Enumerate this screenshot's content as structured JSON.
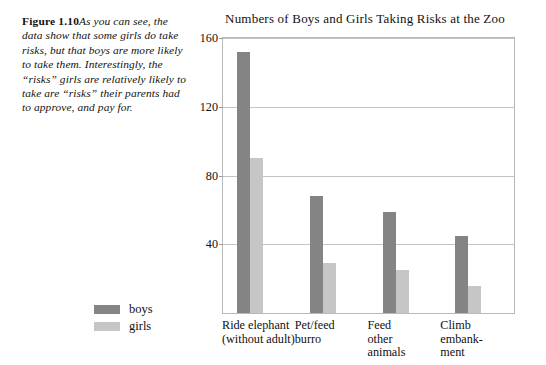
{
  "caption": {
    "label": "Figure 1.10",
    "text": "As you can see, the data show that some girls do take risks, but that boys are more likely to take them. Interestingly, the “risks” girls are relatively likely to take are “risks” their parents had to approve, and pay for."
  },
  "legend": {
    "position": "left-of-plot",
    "entries": [
      {
        "label": "boys",
        "color": "#848484"
      },
      {
        "label": "girls",
        "color": "#c6c6c6"
      }
    ]
  },
  "chart_data": {
    "type": "bar",
    "title": "Numbers of Boys and Girls Taking Risks at the Zoo",
    "xlabel": "",
    "ylabel": "",
    "ylim": [
      0,
      160
    ],
    "yticks": [
      40,
      80,
      120,
      160
    ],
    "ytick_labels": [
      "40",
      "80",
      "120",
      "160"
    ],
    "grid": true,
    "categories": [
      "Ride elephant\n(without adult)",
      "Pet/feed\nburro",
      "Feed\nother\nanimals",
      "Climb\nembank-\nment"
    ],
    "series": [
      {
        "name": "boys",
        "color": "#848484",
        "values": [
          152,
          68,
          59,
          45
        ]
      },
      {
        "name": "girls",
        "color": "#c6c6c6",
        "values": [
          90,
          29,
          25,
          16
        ]
      }
    ]
  }
}
